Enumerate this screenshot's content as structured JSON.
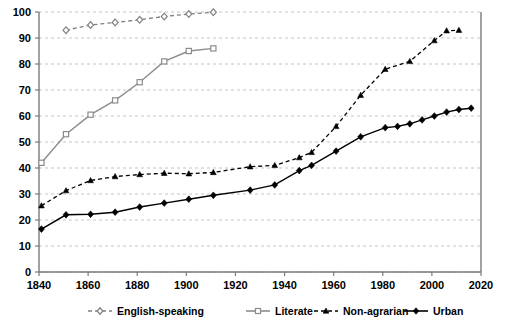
{
  "chart_data": {
    "type": "line",
    "title": "",
    "subtitle": "",
    "xlabel": "",
    "ylabel": "",
    "xlim": [
      1840,
      2020
    ],
    "ylim": [
      0,
      100
    ],
    "xticks": [
      1840,
      1860,
      1880,
      1900,
      1920,
      1940,
      1960,
      1980,
      2000,
      2020
    ],
    "yticks": [
      0,
      10,
      20,
      30,
      40,
      50,
      60,
      70,
      80,
      90,
      100
    ],
    "grid": "horizontal-dashed",
    "legend_position": "bottom",
    "series": [
      {
        "name": "English-speaking",
        "color": "#808080",
        "line_style": "dashed",
        "marker": "diamond",
        "marker_fill": "hollow",
        "points": [
          {
            "x": 1851,
            "y": 93.0
          },
          {
            "x": 1861,
            "y": 95.0
          },
          {
            "x": 1871,
            "y": 96.0
          },
          {
            "x": 1881,
            "y": 97.0
          },
          {
            "x": 1891,
            "y": 98.3
          },
          {
            "x": 1901,
            "y": 99.2
          },
          {
            "x": 1911,
            "y": 99.9
          }
        ]
      },
      {
        "name": "Literate",
        "color": "#8c8c8c",
        "line_style": "solid",
        "marker": "square",
        "marker_fill": "hollow",
        "points": [
          {
            "x": 1841,
            "y": 42.0
          },
          {
            "x": 1851,
            "y": 53.0
          },
          {
            "x": 1861,
            "y": 60.5
          },
          {
            "x": 1871,
            "y": 66.0
          },
          {
            "x": 1881,
            "y": 73.0
          },
          {
            "x": 1891,
            "y": 81.0
          },
          {
            "x": 1901,
            "y": 85.0
          },
          {
            "x": 1911,
            "y": 86.0
          }
        ]
      },
      {
        "name": "Non-agrarian",
        "color": "#000000",
        "line_style": "dashed",
        "marker": "triangle",
        "marker_fill": "solid",
        "points": [
          {
            "x": 1841,
            "y": 25.5
          },
          {
            "x": 1851,
            "y": 31.3
          },
          {
            "x": 1861,
            "y": 35.2
          },
          {
            "x": 1871,
            "y": 36.7
          },
          {
            "x": 1881,
            "y": 37.5
          },
          {
            "x": 1891,
            "y": 38.0
          },
          {
            "x": 1901,
            "y": 37.8
          },
          {
            "x": 1911,
            "y": 38.3
          },
          {
            "x": 1926,
            "y": 40.5
          },
          {
            "x": 1936,
            "y": 41.0
          },
          {
            "x": 1946,
            "y": 44.0
          },
          {
            "x": 1951,
            "y": 46.0
          },
          {
            "x": 1961,
            "y": 56.0
          },
          {
            "x": 1971,
            "y": 68.0
          },
          {
            "x": 1981,
            "y": 78.0
          },
          {
            "x": 1991,
            "y": 81.0
          },
          {
            "x": 2001,
            "y": 89.0
          },
          {
            "x": 2006,
            "y": 92.8
          },
          {
            "x": 2011,
            "y": 93.0
          }
        ]
      },
      {
        "name": "Urban",
        "color": "#000000",
        "line_style": "solid",
        "marker": "diamond",
        "marker_fill": "solid",
        "points": [
          {
            "x": 1841,
            "y": 16.5
          },
          {
            "x": 1851,
            "y": 22.0
          },
          {
            "x": 1861,
            "y": 22.2
          },
          {
            "x": 1871,
            "y": 23.0
          },
          {
            "x": 1881,
            "y": 25.0
          },
          {
            "x": 1891,
            "y": 26.5
          },
          {
            "x": 1901,
            "y": 28.0
          },
          {
            "x": 1911,
            "y": 29.5
          },
          {
            "x": 1926,
            "y": 31.5
          },
          {
            "x": 1936,
            "y": 33.5
          },
          {
            "x": 1946,
            "y": 39.0
          },
          {
            "x": 1951,
            "y": 41.0
          },
          {
            "x": 1961,
            "y": 46.5
          },
          {
            "x": 1971,
            "y": 52.0
          },
          {
            "x": 1981,
            "y": 55.5
          },
          {
            "x": 1986,
            "y": 56.0
          },
          {
            "x": 1991,
            "y": 57.0
          },
          {
            "x": 1996,
            "y": 58.5
          },
          {
            "x": 2001,
            "y": 60.0
          },
          {
            "x": 2006,
            "y": 61.5
          },
          {
            "x": 2011,
            "y": 62.5
          },
          {
            "x": 2016,
            "y": 63.0
          }
        ]
      }
    ]
  },
  "legend": {
    "items": [
      {
        "label": "English-speaking"
      },
      {
        "label": "Literate"
      },
      {
        "label": "Non-agrarian"
      },
      {
        "label": "Urban"
      }
    ]
  }
}
